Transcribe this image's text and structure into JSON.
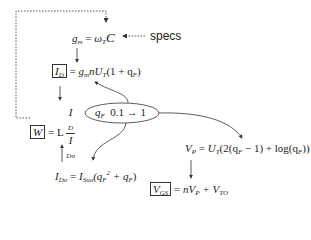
{
  "specs_label": "specs",
  "equations": {
    "gm": {
      "lhs": "g",
      "lhs_sub": "m",
      "rhs": "ω",
      "rhs_sub": "T",
      "tail": "C"
    },
    "id": {
      "lhs": "I",
      "lhs_sub": "D",
      "rhs": "g",
      "rhs_sub": "m",
      "tail": "nU",
      "tail_sub": "T",
      "paren": "(1 + q",
      "paren_sub": "F",
      "close": ")"
    },
    "w": {
      "lhs": "W",
      "eq": "= L",
      "num": "I",
      "num_sub": "D",
      "den": "I",
      "den_sub": "Do"
    },
    "qf": {
      "var": "q",
      "var_sub": "F",
      "range": "0.1 → 1"
    },
    "ido": {
      "lhs": "I",
      "lhs_sub": "Do",
      "rhs": "I",
      "rhs_sub": "Suo",
      "paren_open": "(q",
      "sq_sub": "F",
      "sq_sup": "2",
      "plus": " + q",
      "plus_sub": "F",
      "close": ")"
    },
    "vp": {
      "lhs": "V",
      "lhs_sub": "P",
      "rhs": "U",
      "rhs_sub": "T",
      "body": "(2(q",
      "body_sub": "F",
      "mid": " − 1) + log(q",
      "mid_sub": "F",
      "close": "))"
    },
    "vgs": {
      "lhs": "V",
      "lhs_sub": "GS",
      "rhs": "nV",
      "rhs_sub": "P",
      "plus": " + V",
      "plus_sub": "TO"
    }
  }
}
